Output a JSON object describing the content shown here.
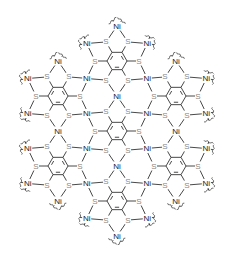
{
  "diagram": {
    "title": "",
    "atom_labels": {
      "sulfur": "S",
      "nickel": "Ni"
    },
    "colors": {
      "bond": "#333333",
      "sulfur_label": "#888888",
      "nickel_label": "#222222",
      "background": "#ffffff"
    },
    "ring_centers": [
      {
        "id": "center",
        "x": 117,
        "y": 131
      },
      {
        "id": "top",
        "x": 117,
        "y": 61
      },
      {
        "id": "bottom",
        "x": 117,
        "y": 201
      },
      {
        "id": "upper-left",
        "x": 58,
        "y": 96
      },
      {
        "id": "upper-right",
        "x": 176,
        "y": 96
      },
      {
        "id": "lower-left",
        "x": 58,
        "y": 166
      },
      {
        "id": "lower-right",
        "x": 176,
        "y": 166
      }
    ],
    "geometry": {
      "carbon_radius": 10,
      "sulfur_radius": 22,
      "nickel_radius": 35
    }
  }
}
